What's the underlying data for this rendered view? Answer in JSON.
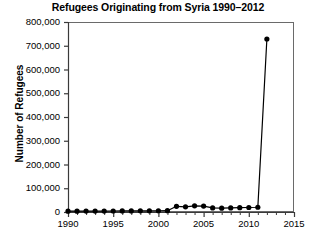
{
  "chart_data": {
    "type": "line",
    "title": "Refugees Originating from Syria 1990–2012",
    "xlabel": "",
    "ylabel": "Number of Refugees",
    "x": [
      1990,
      1991,
      1992,
      1993,
      1994,
      1995,
      1996,
      1997,
      1998,
      1999,
      2000,
      2001,
      2002,
      2003,
      2004,
      2005,
      2006,
      2007,
      2008,
      2009,
      2010,
      2011,
      2012
    ],
    "values": [
      3500,
      3600,
      3700,
      3800,
      4000,
      4200,
      4400,
      4600,
      4800,
      5000,
      5200,
      5400,
      24000,
      22000,
      26000,
      25000,
      17000,
      16000,
      17000,
      18000,
      19000,
      20000,
      728500
    ],
    "series": [
      {
        "name": "Refugees originating from Syria",
        "values": [
          3500,
          3600,
          3700,
          3800,
          4000,
          4200,
          4400,
          4600,
          4800,
          5000,
          5200,
          5400,
          24000,
          22000,
          26000,
          25000,
          17000,
          16000,
          17000,
          18000,
          19000,
          20000,
          728500
        ]
      }
    ],
    "xlim": [
      1990,
      2015
    ],
    "ylim": [
      0,
      800000
    ],
    "xticks": [
      1990,
      1995,
      2000,
      2005,
      2010,
      2015
    ],
    "xtick_labels": [
      "1990",
      "1995",
      "2000",
      "2005",
      "2010",
      "2015"
    ],
    "xminor_step": 1,
    "yticks": [
      0,
      100000,
      200000,
      300000,
      400000,
      500000,
      600000,
      700000,
      800000
    ],
    "ytick_labels": [
      "0",
      "100,000",
      "200,000",
      "300,000",
      "400,000",
      "500,000",
      "600,000",
      "700,000",
      "800,000"
    ],
    "grid": false,
    "legend": null,
    "line_color": "#000000",
    "marker": "circle",
    "marker_color": "#000000",
    "plot_border": true,
    "background_color": "#ffffff"
  }
}
